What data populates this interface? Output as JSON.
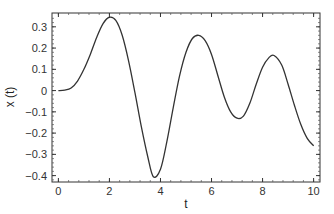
{
  "chart_data": {
    "type": "line",
    "title": "",
    "xlabel": "t",
    "ylabel": "x (t)",
    "xlim": [
      -0.25,
      10.25
    ],
    "ylim": [
      -0.43,
      0.365
    ],
    "xticks": [
      0,
      2,
      4,
      6,
      8,
      10
    ],
    "xtick_labels": [
      "0",
      "2",
      "4",
      "6",
      "8",
      "10"
    ],
    "yticks": [
      0.3,
      0.2,
      0.1,
      0,
      -0.1,
      -0.2,
      -0.3,
      -0.4
    ],
    "ytick_labels": [
      "0.3",
      "0.2",
      "0.1",
      "0",
      "−0.1",
      "−0.2",
      "−0.3",
      "−0.4"
    ],
    "grid": false,
    "legend": null,
    "series": [
      {
        "name": "x(t)",
        "color": "#333333",
        "x": [
          0,
          0.25,
          0.5,
          0.75,
          1.0,
          1.25,
          1.5,
          1.75,
          2.0,
          2.25,
          2.5,
          2.75,
          3.0,
          3.25,
          3.5,
          3.72,
          4.0,
          4.25,
          4.5,
          4.75,
          5.0,
          5.25,
          5.5,
          5.75,
          6.0,
          6.25,
          6.5,
          6.75,
          7.0,
          7.25,
          7.5,
          7.75,
          8.0,
          8.25,
          8.45,
          8.75,
          9.0,
          9.25,
          9.5,
          9.75,
          10.0
        ],
        "values": [
          0.0,
          0.002,
          0.012,
          0.045,
          0.1,
          0.17,
          0.25,
          0.315,
          0.345,
          0.33,
          0.26,
          0.14,
          -0.01,
          -0.17,
          -0.31,
          -0.405,
          -0.37,
          -0.24,
          -0.08,
          0.07,
          0.18,
          0.245,
          0.26,
          0.235,
          0.17,
          0.07,
          -0.03,
          -0.1,
          -0.13,
          -0.12,
          -0.06,
          0.03,
          0.11,
          0.155,
          0.165,
          0.12,
          0.03,
          -0.07,
          -0.16,
          -0.225,
          -0.26
        ]
      }
    ]
  },
  "axes": {
    "xlabel": "t",
    "ylabel": "x (t)"
  }
}
